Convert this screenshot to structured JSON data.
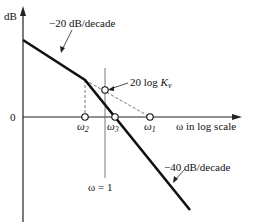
{
  "diagram": {
    "type": "bode-magnitude-asymptote",
    "y_axis_label": "dB",
    "zero_label": "0",
    "x_axis_label": "ω in log scale",
    "slope1_label": "−20 dB/decade",
    "slope2_label": "−40 dB/decade",
    "kv_label_prefix": "20 log ",
    "kv_symbol": "K",
    "kv_sub": "v",
    "omega_unity_label": "ω = 1",
    "points": [
      {
        "name": "ω",
        "sub": "2"
      },
      {
        "name": "ω",
        "sub": "3"
      },
      {
        "name": "ω",
        "sub": "1"
      }
    ]
  }
}
